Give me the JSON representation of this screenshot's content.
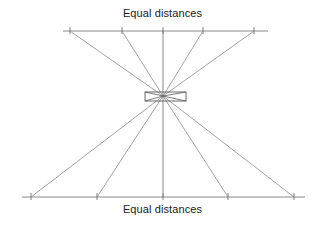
{
  "figure": {
    "labels": {
      "top": "Equal distances",
      "bottom": "Equal distances"
    },
    "colors": {
      "line": "#8c8c8c",
      "axis": "#7a7a7a",
      "lens_stroke": "#555555",
      "text": "#1a1a1a",
      "background": "#ffffff"
    },
    "geometry": {
      "convergence_point": {
        "x": 163,
        "y": 96
      },
      "top_axis": {
        "x1": 63,
        "x2": 268,
        "y": 31
      },
      "bottom_axis": {
        "x1": 22,
        "x2": 305,
        "y": 197
      },
      "tick_length": 7,
      "top_ticks": [
        70,
        122,
        163,
        203,
        254
      ],
      "bottom_ticks": [
        31,
        97,
        163,
        228,
        294
      ],
      "lens": {
        "x": 145,
        "y": 92,
        "width": 41,
        "height": 9
      },
      "vertical_axis": {
        "x": 163,
        "y1": 31,
        "y2": 197
      }
    },
    "rays": [
      {
        "name": "ray-outer-left",
        "top_x": 70,
        "bottom_x": 294
      },
      {
        "name": "ray-inner-left",
        "top_x": 122,
        "bottom_x": 228
      },
      {
        "name": "ray-center",
        "top_x": 163,
        "bottom_x": 163
      },
      {
        "name": "ray-inner-right",
        "top_x": 203,
        "bottom_x": 97
      },
      {
        "name": "ray-outer-right",
        "top_x": 254,
        "bottom_x": 31
      }
    ]
  }
}
